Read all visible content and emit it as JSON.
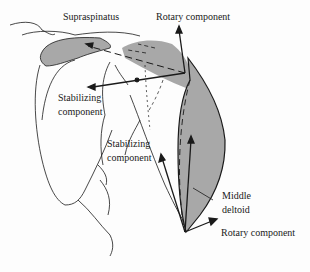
{
  "diagram": {
    "labels": {
      "supraspinatus": "Supraspinatus",
      "rotary_top": "Rotary component",
      "stabilizing_top_1": "Stabilizing",
      "stabilizing_top_2": "component",
      "stabilizing_mid_1": "Stabilizing",
      "stabilizing_mid_2": "component",
      "middle_deltoid_1": "Middle",
      "middle_deltoid_2": "deltoid",
      "rotary_bottom": "Rotary component"
    },
    "colors": {
      "muscle_fill": "#a8a8a8",
      "line": "#1a1a1a",
      "background": "#fdfdfd"
    }
  }
}
